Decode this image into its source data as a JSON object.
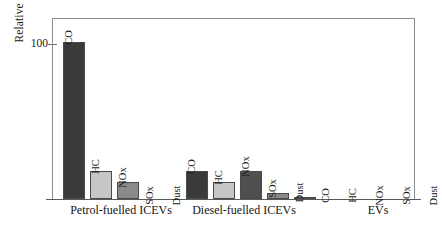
{
  "chart_data": {
    "type": "bar",
    "title": "",
    "xlabel": "",
    "ylabel": "Relative emissions (%)",
    "ylim": [
      0,
      115
    ],
    "yticks": [
      100
    ],
    "ytick_labels": [
      "100"
    ],
    "grid": false,
    "legend_position": "none",
    "categories": [
      "Petrol-fuelled ICEVs",
      "Diesel-fuelled ICEVs",
      "EVs"
    ],
    "pollutants": [
      "CO",
      "HC",
      "NOx",
      "SOx",
      "Dust"
    ],
    "series": [
      {
        "name": "CO",
        "values": [
          100,
          18,
          0
        ]
      },
      {
        "name": "HC",
        "values": [
          18,
          11,
          0
        ]
      },
      {
        "name": "NOx",
        "values": [
          11,
          18,
          0
        ]
      },
      {
        "name": "SOx",
        "values": [
          0,
          4,
          0
        ]
      },
      {
        "name": "Dust",
        "values": [
          0,
          1.5,
          0
        ]
      }
    ],
    "groups": [
      {
        "label": "Petrol-fuelled ICEVs",
        "bars": [
          {
            "label": "CO",
            "value": 100,
            "color": "#3a3a3a"
          },
          {
            "label": "HC",
            "value": 18,
            "color": "#c6c6c6"
          },
          {
            "label": "NOx",
            "value": 11,
            "color": "#8a8a8a"
          },
          {
            "label": "SOx",
            "value": 0,
            "color": "#8a8a8a"
          },
          {
            "label": "Dust",
            "value": 0,
            "color": "#3a3a3a"
          }
        ]
      },
      {
        "label": "Diesel-fuelled ICEVs",
        "bars": [
          {
            "label": "CO",
            "value": 18,
            "color": "#3a3a3a"
          },
          {
            "label": "HC",
            "value": 11,
            "color": "#c6c6c6"
          },
          {
            "label": "NOx",
            "value": 18,
            "color": "#4f4f4f"
          },
          {
            "label": "SOx",
            "value": 4,
            "color": "#8a8a8a"
          },
          {
            "label": "Dust",
            "value": 1.5,
            "color": "#2b2b2b"
          }
        ]
      },
      {
        "label": "EVs",
        "bars": [
          {
            "label": "CO",
            "value": 0,
            "color": "#3a3a3a"
          },
          {
            "label": "HC",
            "value": 0,
            "color": "#c6c6c6"
          },
          {
            "label": "NOx",
            "value": 0,
            "color": "#8a8a8a"
          },
          {
            "label": "SOx",
            "value": 0,
            "color": "#8a8a8a"
          },
          {
            "label": "Dust",
            "value": 0,
            "color": "#3a3a3a"
          }
        ]
      }
    ]
  }
}
